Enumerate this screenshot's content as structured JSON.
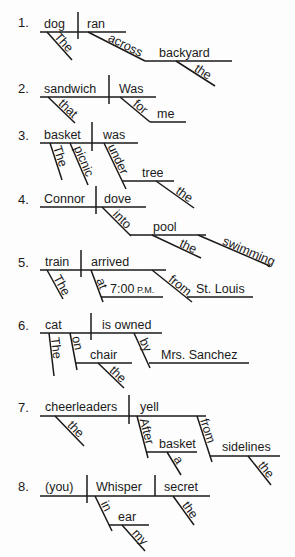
{
  "diagrams": [
    {
      "number": "1.",
      "subject": "dog",
      "verb": "ran",
      "modifiers": [
        {
          "role": "article",
          "word": "The",
          "attaches_to": "dog"
        },
        {
          "role": "preposition",
          "word": "across",
          "attaches_to": "ran",
          "object": "backyard",
          "object_modifiers": [
            {
              "role": "article",
              "word": "the"
            }
          ]
        }
      ]
    },
    {
      "number": "2.",
      "subject": "sandwich",
      "verb": "Was",
      "modifiers": [
        {
          "role": "adjective",
          "word": "that",
          "attaches_to": "sandwich"
        },
        {
          "role": "preposition",
          "word": "for",
          "attaches_to": "Was",
          "object": "me"
        }
      ]
    },
    {
      "number": "3.",
      "subject": "basket",
      "verb": "was",
      "modifiers": [
        {
          "role": "article",
          "word": "The",
          "attaches_to": "basket"
        },
        {
          "role": "adjective",
          "word": "picnic",
          "attaches_to": "basket"
        },
        {
          "role": "preposition",
          "word": "under",
          "attaches_to": "was",
          "object": "tree",
          "object_modifiers": [
            {
              "role": "article",
              "word": "the"
            }
          ]
        }
      ]
    },
    {
      "number": "4.",
      "subject": "Connor",
      "verb": "dove",
      "modifiers": [
        {
          "role": "preposition",
          "word": "into",
          "attaches_to": "dove",
          "object": "pool",
          "object_modifiers": [
            {
              "role": "article",
              "word": "the"
            },
            {
              "role": "adjective",
              "word": "swimming"
            }
          ]
        }
      ]
    },
    {
      "number": "5.",
      "subject": "train",
      "verb": "arrived",
      "modifiers": [
        {
          "role": "article",
          "word": "The",
          "attaches_to": "train"
        },
        {
          "role": "preposition",
          "word": "at",
          "attaches_to": "arrived",
          "object": "7:00",
          "object_suffix": "P.M."
        },
        {
          "role": "preposition",
          "word": "from",
          "attaches_to": "arrived",
          "object": "St. Louis"
        }
      ]
    },
    {
      "number": "6.",
      "subject": "cat",
      "verb": "is owned",
      "modifiers": [
        {
          "role": "article",
          "word": "The",
          "attaches_to": "cat"
        },
        {
          "role": "preposition",
          "word": "on",
          "attaches_to": "cat",
          "object": "chair",
          "object_modifiers": [
            {
              "role": "article",
              "word": "the"
            }
          ]
        },
        {
          "role": "preposition",
          "word": "by",
          "attaches_to": "is owned",
          "object": "Mrs. Sanchez"
        }
      ]
    },
    {
      "number": "7.",
      "subject": "cheerleaders",
      "verb": "yell",
      "modifiers": [
        {
          "role": "article",
          "word": "the",
          "attaches_to": "cheerleaders"
        },
        {
          "role": "preposition",
          "word": "After",
          "attaches_to": "yell",
          "object": "basket",
          "object_modifiers": [
            {
              "role": "article",
              "word": "a"
            }
          ]
        },
        {
          "role": "preposition",
          "word": "from",
          "attaches_to": "yell",
          "object": "sidelines",
          "object_modifiers": [
            {
              "role": "article",
              "word": "the"
            }
          ]
        }
      ]
    },
    {
      "number": "8.",
      "subject": "(you)",
      "verb": "Whisper",
      "direct_object": "secret",
      "modifiers": [
        {
          "role": "preposition",
          "word": "in",
          "attaches_to": "Whisper",
          "object": "ear",
          "object_modifiers": [
            {
              "role": "possessive",
              "word": "my"
            }
          ]
        },
        {
          "role": "article",
          "word": "the",
          "attaches_to": "secret"
        }
      ]
    }
  ]
}
